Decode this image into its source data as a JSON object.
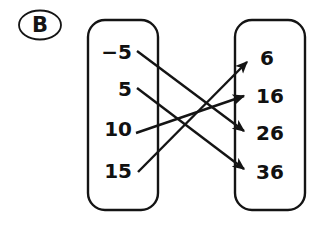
{
  "figure": {
    "part_label": "B",
    "type": "mapping-diagram",
    "line_color": "#141414",
    "box_border_color": "#141414",
    "background": "#ffffff"
  },
  "domain_box": {
    "name": "input-set",
    "values": [
      "−5",
      "5",
      "10",
      "15"
    ]
  },
  "range_box": {
    "name": "output-set",
    "values": [
      "6",
      "16",
      "26",
      "36"
    ]
  },
  "chart_data": {
    "type": "diagram",
    "title": "B",
    "domain": [
      "-5",
      "5",
      "10",
      "15"
    ],
    "range": [
      "6",
      "16",
      "26",
      "36"
    ],
    "mappings": [
      {
        "from": "-5",
        "to": "26"
      },
      {
        "from": "5",
        "to": "36"
      },
      {
        "from": "10",
        "to": "16"
      },
      {
        "from": "15",
        "to": "6"
      }
    ]
  },
  "geometry": {
    "domain_box": {
      "x": 88,
      "y": 20,
      "w": 70,
      "h": 190,
      "r": 17
    },
    "range_box": {
      "x": 235,
      "y": 20,
      "w": 70,
      "h": 190,
      "r": 17
    },
    "domain_value_y": [
      52,
      89,
      129,
      171
    ],
    "range_value_y": [
      58,
      96,
      133,
      172
    ],
    "arrows": [
      {
        "x1": 137,
        "y1": 51,
        "x2": 244,
        "y2": 131
      },
      {
        "x1": 137,
        "y1": 88,
        "x2": 244,
        "y2": 169
      },
      {
        "x1": 136,
        "y1": 133,
        "x2": 244,
        "y2": 96
      },
      {
        "x1": 138,
        "y1": 172,
        "x2": 247,
        "y2": 62
      }
    ]
  }
}
